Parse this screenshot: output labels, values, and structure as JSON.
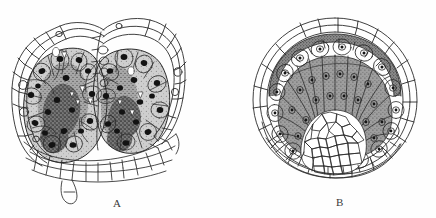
{
  "plate": {
    "caption_labels": [
      "A",
      "B"
    ],
    "background_color": "#fefefe",
    "ink_color": "#2b2b2b",
    "panels": [
      {
        "id": "A",
        "label": "A",
        "label_x": 118,
        "label_y": 205,
        "description": "Transverse section through a two-lobed anther / sporangium pair showing epidermis, endothecium and sporogenous tissue with darkly stained nuclei",
        "bounds": {
          "x": 12,
          "y": 14,
          "w": 166,
          "h": 172
        },
        "structures": [
          {
            "name": "epidermis",
            "tone": "#ffffff",
            "note": "outer single layer of large polygonal cells"
          },
          {
            "name": "hypodermis",
            "tone": "#fdfdfd",
            "note": "second thin cell layer following lobe contour"
          },
          {
            "name": "left-lobe-locule",
            "tone": "#b4b4b4"
          },
          {
            "name": "right-lobe-locule",
            "tone": "#b8b8b8"
          },
          {
            "name": "sporogenous-mass",
            "tone": "#6e6e6e"
          },
          {
            "name": "nuclei",
            "tone": "#141414",
            "count": 46
          },
          {
            "name": "ground-parenchyma",
            "tone": "#ffffff",
            "note": "polygonal cells forming the base and connective"
          },
          {
            "name": "basal-projection",
            "tone": "#ffffff",
            "note": "small two-cell outgrowth at lower left"
          }
        ]
      },
      {
        "id": "B",
        "label": "B",
        "label_x": 340,
        "label_y": 204,
        "description": "Transverse section of a single sporangium showing concentric wall layers, a ring of vacuolate cells and radially elongated wedge-shaped cells around a central core of small isodiametric cells",
        "bounds": {
          "x": 245,
          "y": 16,
          "w": 180,
          "h": 170
        },
        "structures": [
          {
            "name": "outer-epidermis",
            "tone": "#ffffff"
          },
          {
            "name": "wall-arc-layer",
            "tone": "#8a8a8a",
            "note": "dark banded arc beneath epidermis"
          },
          {
            "name": "vacuolate-cell-ring",
            "tone": "#bdbdbd",
            "note": "rounded cells each with a central nucleus dot"
          },
          {
            "name": "radiating-wedge-cells",
            "tone": "#9a9a9a",
            "count": 11
          },
          {
            "name": "central-core",
            "tone": "#ffffff",
            "note": "dome of small isodiametric parenchyma cells"
          },
          {
            "name": "basal-parenchyma",
            "tone": "#ffffff"
          }
        ]
      }
    ]
  }
}
